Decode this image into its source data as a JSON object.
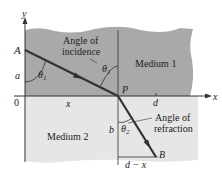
{
  "diagram": {
    "axes": {
      "x_label": "x",
      "y_label": "y",
      "origin_label": "0"
    },
    "points": {
      "A": "A",
      "P": "P",
      "B": "B"
    },
    "media": {
      "upper": "Medium 1",
      "lower": "Medium 2"
    },
    "distances": {
      "a": "a",
      "b": "b",
      "x": "x",
      "d": "d",
      "d_minus_x": "d − x"
    },
    "angles": {
      "theta1": "θ",
      "theta1_sub": "1",
      "theta2": "θ",
      "theta2_sub": "2",
      "incidence_line1": "Angle of",
      "incidence_line2": "incidence",
      "refraction_line1": "Angle of",
      "refraction_line2": "refraction"
    },
    "colors": {
      "medium1": "#a9a9a9",
      "medium2": "#e6e6e6",
      "ray": "#333333",
      "axis": "#333333"
    }
  }
}
